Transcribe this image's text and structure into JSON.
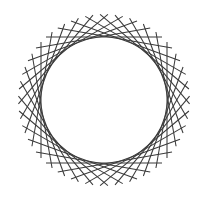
{
  "figure": {
    "background_color": "#ffffff",
    "stroke_color": "#3a3a3a",
    "stroke_width": 1.05,
    "canvas": {
      "width": 213,
      "height": 199
    }
  },
  "chart_data": {
    "type": "scatter",
    "subtitle": "",
    "xlabel": "",
    "ylabel": "",
    "grid": false,
    "legend": null,
    "xlim": [
      0,
      213
    ],
    "ylim": [
      0,
      199
    ],
    "geometry": {
      "center_x": 104,
      "center_y": 100,
      "envelope_radius": 63,
      "segment_count": 36,
      "rotation_step_degrees": 10,
      "segment_half_length": 58,
      "outer_reach_radius": 86,
      "start_angle_degrees": 0
    },
    "segments": [
      {
        "index": 0,
        "angle": 0,
        "tangent_x": 167.0,
        "tangent_y": 100.0
      },
      {
        "index": 1,
        "angle": 10,
        "tangent_x": 166.0,
        "tangent_y": 89.1
      },
      {
        "index": 2,
        "angle": 20,
        "tangent_x": 163.2,
        "tangent_y": 78.5
      },
      {
        "index": 3,
        "angle": 30,
        "tangent_x": 158.6,
        "tangent_y": 68.5
      },
      {
        "index": 4,
        "angle": 40,
        "tangent_x": 152.3,
        "tangent_y": 59.5
      },
      {
        "index": 5,
        "angle": 50,
        "tangent_x": 144.5,
        "tangent_y": 51.7
      },
      {
        "index": 6,
        "angle": 60,
        "tangent_x": 135.5,
        "tangent_y": 45.4
      },
      {
        "index": 7,
        "angle": 70,
        "tangent_x": 125.5,
        "tangent_y": 40.8
      },
      {
        "index": 8,
        "angle": 80,
        "tangent_x": 114.9,
        "tangent_y": 38.0
      },
      {
        "index": 9,
        "angle": 90,
        "tangent_x": 104.0,
        "tangent_y": 37.0
      },
      {
        "index": 10,
        "angle": 100,
        "tangent_x": 93.1,
        "tangent_y": 38.0
      },
      {
        "index": 11,
        "angle": 110,
        "tangent_x": 82.5,
        "tangent_y": 40.8
      },
      {
        "index": 12,
        "angle": 120,
        "tangent_x": 72.5,
        "tangent_y": 45.4
      },
      {
        "index": 13,
        "angle": 130,
        "tangent_x": 63.5,
        "tangent_y": 51.7
      },
      {
        "index": 14,
        "angle": 140,
        "tangent_x": 55.7,
        "tangent_y": 59.5
      },
      {
        "index": 15,
        "angle": 150,
        "tangent_x": 49.4,
        "tangent_y": 68.5
      },
      {
        "index": 16,
        "angle": 160,
        "tangent_x": 44.8,
        "tangent_y": 78.5
      },
      {
        "index": 17,
        "angle": 170,
        "tangent_x": 42.0,
        "tangent_y": 89.1
      },
      {
        "index": 18,
        "angle": 180,
        "tangent_x": 41.0,
        "tangent_y": 100.0
      },
      {
        "index": 19,
        "angle": 190,
        "tangent_x": 42.0,
        "tangent_y": 110.9
      },
      {
        "index": 20,
        "angle": 200,
        "tangent_x": 44.8,
        "tangent_y": 121.5
      },
      {
        "index": 21,
        "angle": 210,
        "tangent_x": 49.4,
        "tangent_y": 131.5
      },
      {
        "index": 22,
        "angle": 220,
        "tangent_x": 55.7,
        "tangent_y": 140.5
      },
      {
        "index": 23,
        "angle": 230,
        "tangent_x": 63.5,
        "tangent_y": 148.3
      },
      {
        "index": 24,
        "angle": 240,
        "tangent_x": 72.5,
        "tangent_y": 154.6
      },
      {
        "index": 25,
        "angle": 250,
        "tangent_x": 82.5,
        "tangent_y": 159.2
      },
      {
        "index": 26,
        "angle": 260,
        "tangent_x": 93.1,
        "tangent_y": 162.0
      },
      {
        "index": 27,
        "angle": 270,
        "tangent_x": 104.0,
        "tangent_y": 163.0
      },
      {
        "index": 28,
        "angle": 280,
        "tangent_x": 114.9,
        "tangent_y": 162.0
      },
      {
        "index": 29,
        "angle": 290,
        "tangent_x": 125.5,
        "tangent_y": 159.2
      },
      {
        "index": 30,
        "angle": 300,
        "tangent_x": 135.5,
        "tangent_y": 154.6
      },
      {
        "index": 31,
        "angle": 310,
        "tangent_x": 144.5,
        "tangent_y": 148.3
      },
      {
        "index": 32,
        "angle": 320,
        "tangent_x": 152.3,
        "tangent_y": 140.5
      },
      {
        "index": 33,
        "angle": 330,
        "tangent_x": 158.6,
        "tangent_y": 131.5
      },
      {
        "index": 34,
        "angle": 340,
        "tangent_x": 163.2,
        "tangent_y": 121.5
      },
      {
        "index": 35,
        "angle": 350,
        "tangent_x": 166.0,
        "tangent_y": 110.9
      }
    ]
  }
}
